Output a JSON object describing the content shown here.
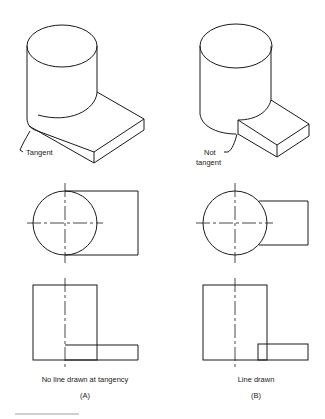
{
  "figure": {
    "panels": [
      {
        "id": "A",
        "callout": "Tangent",
        "caption": "No line drawn at  tangency",
        "label": "(A)"
      },
      {
        "id": "B",
        "callout_line1": "Not",
        "callout_line2": "tangent",
        "caption": "Line drawn",
        "label": "(B)"
      }
    ],
    "colors": {
      "line": "#1a1a1a",
      "background": "#ffffff"
    }
  }
}
